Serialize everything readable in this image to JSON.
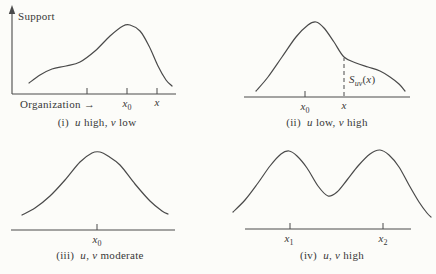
{
  "figure": {
    "width": 436,
    "height": 274,
    "background": "#fcfcf9",
    "line_color": "#4a4a4a",
    "text_color": "#383838"
  },
  "panels": [
    {
      "id": "i",
      "caption": {
        "x": 97,
        "y": 116,
        "segments": [
          {
            "t": "(i)  "
          },
          {
            "t": "u",
            "i": true
          },
          {
            "t": " high, "
          },
          {
            "t": "v",
            "i": true
          },
          {
            "t": " low"
          }
        ]
      },
      "axis": {
        "x1": 12,
        "y": 94,
        "x2": 176
      },
      "y_axis": {
        "x": 12,
        "y_top": 10
      },
      "ticks": [
        {
          "x": 87
        },
        {
          "x": 127
        },
        {
          "x": 157
        }
      ],
      "curve": [
        [
          29,
          83
        ],
        [
          40,
          75
        ],
        [
          52,
          69
        ],
        [
          66,
          66
        ],
        [
          80,
          62
        ],
        [
          95,
          51
        ],
        [
          110,
          36
        ],
        [
          123,
          26
        ],
        [
          130,
          25
        ],
        [
          140,
          31
        ],
        [
          149,
          46
        ],
        [
          158,
          66
        ],
        [
          166,
          80
        ],
        [
          172,
          86
        ]
      ],
      "labels": [
        {
          "name": "support-axis-label",
          "x": 18,
          "y": 10,
          "align": "left",
          "segments": [
            {
              "t": "Support"
            }
          ]
        },
        {
          "name": "organization-axis-label",
          "x": 20,
          "y": 98,
          "align": "left",
          "segments": [
            {
              "t": "Organization "
            },
            {
              "t": "→"
            }
          ]
        },
        {
          "name": "tick-label-x0",
          "x": 127,
          "y": 97,
          "align": "center",
          "segments": [
            {
              "t": "x",
              "i": true
            },
            {
              "t": "0",
              "sub": true
            }
          ]
        },
        {
          "name": "tick-label-x",
          "x": 157,
          "y": 96,
          "align": "center",
          "segments": [
            {
              "t": "x",
              "i": true
            }
          ]
        }
      ]
    },
    {
      "id": "ii",
      "caption": {
        "x": 327,
        "y": 116,
        "segments": [
          {
            "t": "(ii)  "
          },
          {
            "t": "u",
            "i": true
          },
          {
            "t": " low, "
          },
          {
            "t": "v",
            "i": true
          },
          {
            "t": " high"
          }
        ]
      },
      "axis": {
        "x1": 244,
        "y": 97,
        "x2": 410
      },
      "ticks": [
        {
          "x": 305
        }
      ],
      "dashed_line": {
        "x": 344,
        "y_top": 58
      },
      "curve": [
        [
          256,
          91
        ],
        [
          268,
          77
        ],
        [
          282,
          57
        ],
        [
          296,
          37
        ],
        [
          308,
          25
        ],
        [
          316,
          22
        ],
        [
          324,
          28
        ],
        [
          334,
          42
        ],
        [
          344,
          57
        ],
        [
          356,
          63
        ],
        [
          368,
          67
        ],
        [
          380,
          71
        ],
        [
          390,
          77
        ],
        [
          399,
          84
        ],
        [
          405,
          91
        ]
      ],
      "labels": [
        {
          "name": "suv-function-label",
          "x": 349,
          "y": 73,
          "align": "left",
          "segments": [
            {
              "t": "S",
              "i": true
            },
            {
              "t": "uv",
              "i": true,
              "sub": true
            },
            {
              "t": "("
            },
            {
              "t": "x",
              "i": true
            },
            {
              "t": ")"
            }
          ]
        },
        {
          "name": "tick-label-x0",
          "x": 305,
          "y": 100,
          "align": "center",
          "segments": [
            {
              "t": "x",
              "i": true
            },
            {
              "t": "0",
              "sub": true
            }
          ]
        },
        {
          "name": "tick-label-x",
          "x": 344,
          "y": 99,
          "align": "center",
          "segments": [
            {
              "t": "x",
              "i": true
            }
          ]
        }
      ]
    },
    {
      "id": "iii",
      "caption": {
        "x": 100,
        "y": 249,
        "segments": [
          {
            "t": "(iii)  "
          },
          {
            "t": "u",
            "i": true
          },
          {
            "t": ", "
          },
          {
            "t": "v",
            "i": true
          },
          {
            "t": " moderate"
          }
        ]
      },
      "axis": {
        "x1": 11,
        "y": 230,
        "x2": 175
      },
      "ticks": [
        {
          "x": 97
        }
      ],
      "curve": [
        [
          22,
          215
        ],
        [
          35,
          208
        ],
        [
          50,
          196
        ],
        [
          65,
          180
        ],
        [
          80,
          162
        ],
        [
          92,
          153
        ],
        [
          100,
          152
        ],
        [
          108,
          156
        ],
        [
          120,
          165
        ],
        [
          135,
          184
        ],
        [
          150,
          201
        ],
        [
          162,
          211
        ],
        [
          168,
          214
        ]
      ],
      "labels": [
        {
          "name": "tick-label-x0",
          "x": 97,
          "y": 233,
          "align": "center",
          "segments": [
            {
              "t": "x",
              "i": true
            },
            {
              "t": "0",
              "sub": true
            }
          ]
        }
      ]
    },
    {
      "id": "iv",
      "caption": {
        "x": 332,
        "y": 249,
        "segments": [
          {
            "t": "(iv)  "
          },
          {
            "t": "u",
            "i": true
          },
          {
            "t": ", "
          },
          {
            "t": "v",
            "i": true
          },
          {
            "t": " high"
          }
        ]
      },
      "axis": {
        "x1": 245,
        "y": 229,
        "x2": 411
      },
      "ticks": [
        {
          "x": 290
        },
        {
          "x": 383
        }
      ],
      "curve": [
        [
          233,
          212
        ],
        [
          245,
          200
        ],
        [
          258,
          183
        ],
        [
          270,
          166
        ],
        [
          281,
          154
        ],
        [
          289,
          151
        ],
        [
          297,
          156
        ],
        [
          307,
          168
        ],
        [
          318,
          186
        ],
        [
          328,
          196
        ],
        [
          337,
          192
        ],
        [
          347,
          180
        ],
        [
          358,
          166
        ],
        [
          370,
          154
        ],
        [
          380,
          150
        ],
        [
          389,
          155
        ],
        [
          399,
          167
        ],
        [
          409,
          185
        ],
        [
          419,
          202
        ],
        [
          427,
          213
        ],
        [
          431,
          217
        ]
      ],
      "labels": [
        {
          "name": "tick-label-x1",
          "x": 289,
          "y": 232,
          "align": "center",
          "segments": [
            {
              "t": "x",
              "i": true
            },
            {
              "t": "1",
              "sub": true
            }
          ]
        },
        {
          "name": "tick-label-x2",
          "x": 383,
          "y": 232,
          "align": "center",
          "segments": [
            {
              "t": "x",
              "i": true
            },
            {
              "t": "2",
              "sub": true
            }
          ]
        }
      ]
    }
  ]
}
